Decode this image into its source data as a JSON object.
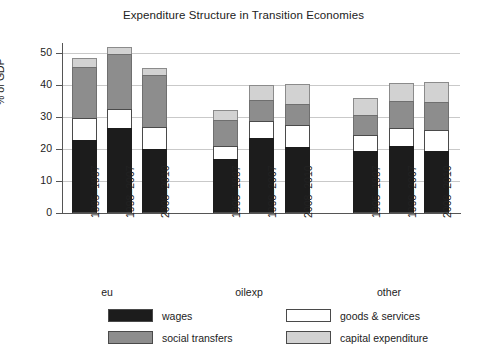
{
  "chart_data": {
    "type": "bar",
    "title": "Expenditure Structure in Transition Economies",
    "xlabel": "",
    "ylabel": "% of GDP",
    "ylim": [
      0,
      52
    ],
    "yticks": [
      0,
      10,
      20,
      30,
      40,
      50
    ],
    "grid": true,
    "stacked": true,
    "legend_position": "bottom",
    "groups": [
      {
        "name": "eu",
        "categories": [
          "1995–1997",
          "1998–2007",
          "2008–2010"
        ]
      },
      {
        "name": "oilexp",
        "categories": [
          "1995–1997",
          "1998–2007",
          "2008–2010"
        ]
      },
      {
        "name": "other",
        "categories": [
          "1995–1997",
          "1998–2007",
          "2008–2010"
        ]
      }
    ],
    "categories": [
      "eu 1995–1997",
      "eu 1998–2007",
      "eu 2008–2010",
      "oilexp 1995–1997",
      "oilexp 1998–2007",
      "oilexp 2008–2010",
      "other 1995–1997",
      "other 1998–2007",
      "other 2008–2010"
    ],
    "series": [
      {
        "name": "wages",
        "color": "#1c1c1c",
        "values": [
          22.8,
          26.6,
          20.2,
          16.9,
          23.5,
          20.8,
          19.4,
          21.1,
          19.4
        ]
      },
      {
        "name": "goods & services",
        "color": "#ffffff",
        "values": [
          6.9,
          6.0,
          6.6,
          4.2,
          5.4,
          6.9,
          5.1,
          5.4,
          6.6
        ]
      },
      {
        "name": "social transfers",
        "color": "#8d8d8d",
        "values": [
          16.0,
          17.2,
          16.3,
          7.9,
          6.6,
          6.6,
          6.3,
          8.5,
          8.8
        ]
      },
      {
        "name": "capital expenditure",
        "color": "#d2d2d2",
        "values": [
          2.9,
          2.1,
          2.4,
          3.3,
          4.5,
          6.0,
          5.1,
          5.7,
          6.3
        ]
      }
    ],
    "totals": [
      48.6,
      51.9,
      45.5,
      32.3,
      40.0,
      40.3,
      35.9,
      40.7,
      41.1
    ]
  },
  "legend": {
    "items": [
      {
        "label": "wages",
        "swatch": "wages-swatch"
      },
      {
        "label": "social transfers",
        "swatch": "social-transfers-swatch"
      },
      {
        "label": "goods & services",
        "swatch": "goods-services-swatch"
      },
      {
        "label": "capital expenditure",
        "swatch": "capital-expenditure-swatch"
      }
    ]
  }
}
